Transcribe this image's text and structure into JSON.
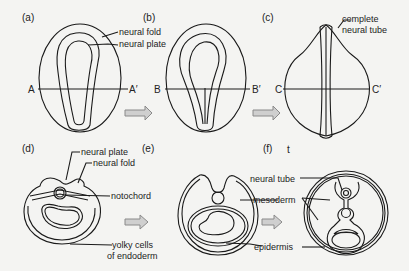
{
  "figure": {
    "panels": {
      "a": "(a)",
      "b": "(b)",
      "c": "(c)",
      "d": "(d)",
      "e": "(e)",
      "f": "(f)"
    },
    "stray_mark": "t",
    "section_lines": {
      "a": {
        "left": "A",
        "right": "A′"
      },
      "b": {
        "left": "B",
        "right": "B′"
      },
      "c": {
        "left": "C",
        "right": "C′"
      }
    },
    "labels": {
      "a_neural_fold": "neural fold",
      "a_neural_plate": "neural plate",
      "c_complete_line1": "complete",
      "c_complete_line2": "neural tube",
      "d_neural_plate": "neural plate",
      "d_neural_fold": "neural fold",
      "notochord": "notochord",
      "yolky_line1": "yolky cells",
      "yolky_line2": "of endoderm",
      "neural_tube": "neural tube",
      "mesoderm": "mesoderm",
      "epidermis": "epidermis"
    },
    "colors": {
      "line": "#1a1a1a",
      "arrow_fill": "#cfcfcf",
      "arrow_stroke": "#8a8a8a",
      "background": "#f4f4f2"
    }
  }
}
